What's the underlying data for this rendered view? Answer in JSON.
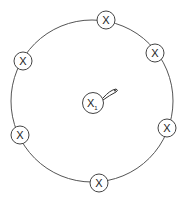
{
  "diagram": {
    "ring": {
      "cx": 92,
      "cy": 101,
      "r": 81,
      "stroke": "#555555"
    },
    "center_node": {
      "label": "X",
      "subscript": "1",
      "cx": 93,
      "cy": 103,
      "r": 10.5
    },
    "outer_nodes": [
      {
        "label": "X",
        "cx": 106,
        "cy": 20
      },
      {
        "label": "X",
        "cx": 155,
        "cy": 53
      },
      {
        "label": "X",
        "cx": 23,
        "cy": 61
      },
      {
        "label": "X",
        "cx": 167,
        "cy": 128
      },
      {
        "label": "X",
        "cx": 20,
        "cy": 135
      },
      {
        "label": "X",
        "cx": 99,
        "cy": 183
      }
    ],
    "self_loop": {
      "attached_to": "center_node"
    }
  }
}
